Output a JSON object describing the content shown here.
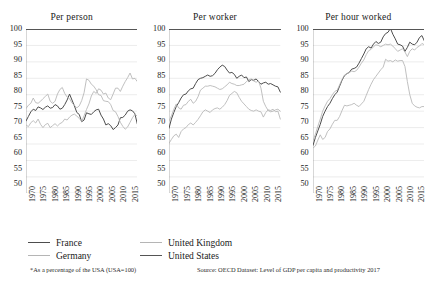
{
  "chart_data": {
    "type": "line",
    "title": "",
    "subtitle": "",
    "xlabel": "",
    "ylabel": "",
    "ylim": [
      50,
      100
    ],
    "xlim": [
      1970,
      2016
    ],
    "ytick_step": 5,
    "yticks": [
      50,
      55,
      60,
      65,
      70,
      75,
      80,
      85,
      90,
      95,
      100
    ],
    "xticks": [
      1970,
      1975,
      1980,
      1985,
      1990,
      1995,
      2000,
      2005,
      2010,
      2015
    ],
    "grid": true,
    "legend_position": "bottom-left",
    "note": "*As a percentage of the USA (USA=100)",
    "source": "Source: OECD Dataset: Level of GDP per capita and productivity 2017",
    "colors": {
      "France": "#4d4d4d",
      "Germany": "#b5b5b5",
      "United Kingdom": "#b5b5b5",
      "United States": "#555555"
    },
    "x": [
      1970,
      1971,
      1972,
      1973,
      1974,
      1975,
      1976,
      1977,
      1978,
      1979,
      1980,
      1981,
      1982,
      1983,
      1984,
      1985,
      1986,
      1987,
      1988,
      1989,
      1990,
      1991,
      1992,
      1993,
      1994,
      1995,
      1996,
      1997,
      1998,
      1999,
      2000,
      2001,
      2002,
      2003,
      2004,
      2005,
      2006,
      2007,
      2008,
      2009,
      2010,
      2011,
      2012,
      2013,
      2014,
      2015,
      2016
    ],
    "panels": [
      {
        "title": "Per person",
        "series": [
          {
            "name": "France",
            "values": [
              72.0,
              73.4,
              74.8,
              75.6,
              75.2,
              76.3,
              76.0,
              75.5,
              76.2,
              76.6,
              75.9,
              76.1,
              77.0,
              76.6,
              75.6,
              75.9,
              77.0,
              78.4,
              80.2,
              78.4,
              76.6,
              74.6,
              74.0,
              71.8,
              72.3,
              74.5,
              74.2,
              74.0,
              74.8,
              75.4,
              75.6,
              73.8,
              72.6,
              70.8,
              71.2,
              70.6,
              69.4,
              70.0,
              70.8,
              73.0,
              73.1,
              73.8,
              75.0,
              75.4,
              75.1,
              74.2,
              71.1
            ]
          },
          {
            "name": "Germany",
            "values": [
              70.8,
              70.3,
              71.5,
              72.1,
              71.4,
              72.6,
              71.0,
              70.0,
              70.9,
              71.3,
              70.0,
              70.6,
              71.2,
              70.5,
              71.2,
              71.6,
              72.6,
              72.3,
              73.2,
              73.8,
              74.1,
              73.5,
              72.8,
              71.9,
              73.6,
              75.5,
              77.2,
              79.6,
              81.0,
              80.4,
              81.8,
              81.4,
              80.2,
              80.5,
              79.0,
              78.5,
              80.2,
              82.0,
              82.0,
              81.0,
              82.6,
              84.0,
              85.2,
              86.6,
              84.8,
              85.0,
              84.0
            ]
          },
          {
            "name": "United Kingdom",
            "values": [
              75.8,
              76.8,
              77.4,
              79.0,
              77.6,
              77.4,
              78.0,
              78.8,
              79.5,
              80.2,
              78.0,
              77.4,
              78.0,
              80.2,
              81.6,
              82.2,
              80.4,
              79.3,
              78.8,
              77.5,
              76.8,
              76.0,
              76.6,
              78.2,
              80.6,
              84.8,
              84.4,
              83.2,
              82.6,
              81.5,
              80.0,
              79.8,
              78.2,
              78.0,
              77.9,
              77.0,
              75.2,
              74.8,
              73.4,
              71.6,
              70.4,
              69.5,
              70.2,
              71.6,
              73.0,
              74.0,
              73.5
            ]
          },
          {
            "name": "United States",
            "values": [
              100,
              100,
              100,
              100,
              100,
              100,
              100,
              100,
              100,
              100,
              100,
              100,
              100,
              100,
              100,
              100,
              100,
              100,
              100,
              100,
              100,
              100,
              100,
              100,
              100,
              100,
              100,
              100,
              100,
              100,
              100,
              100,
              100,
              100,
              100,
              100,
              100,
              100,
              100,
              100,
              100,
              100,
              100,
              100,
              100,
              100,
              100
            ]
          }
        ]
      },
      {
        "title": "Per worker",
        "series": [
          {
            "name": "France",
            "values": [
              69.8,
              72.6,
              74.6,
              76.4,
              77.6,
              79.0,
              80.0,
              80.2,
              81.2,
              81.8,
              82.0,
              83.4,
              84.6,
              85.0,
              85.2,
              85.6,
              86.0,
              85.6,
              85.8,
              86.5,
              87.6,
              88.4,
              89.0,
              88.6,
              87.5,
              86.6,
              86.8,
              86.2,
              85.0,
              85.6,
              86.0,
              85.2,
              85.4,
              84.0,
              84.6,
              84.4,
              84.8,
              84.0,
              83.2,
              83.6,
              83.8,
              83.2,
              83.4,
              83.0,
              82.6,
              82.4,
              80.8
            ]
          },
          {
            "name": "Germany",
            "values": [
              65.2,
              66.4,
              67.5,
              68.0,
              67.0,
              68.8,
              69.6,
              70.0,
              70.9,
              71.4,
              70.8,
              71.6,
              72.5,
              73.6,
              74.8,
              75.4,
              75.0,
              74.6,
              75.4,
              75.8,
              76.0,
              75.6,
              76.2,
              77.0,
              78.2,
              79.8,
              80.4,
              81.0,
              80.6,
              79.2,
              78.0,
              77.2,
              76.4,
              75.6,
              75.2,
              75.0,
              75.4,
              75.0,
              74.8,
              73.2,
              74.6,
              75.4,
              75.2,
              75.6,
              74.8,
              75.0,
              72.6
            ]
          },
          {
            "name": "United Kingdom",
            "values": [
              72.0,
              73.6,
              75.6,
              77.2,
              76.0,
              75.6,
              76.8,
              77.0,
              78.0,
              78.6,
              77.4,
              78.0,
              79.4,
              81.4,
              82.0,
              82.6,
              82.6,
              82.8,
              82.6,
              82.4,
              82.0,
              81.6,
              81.8,
              82.4,
              83.0,
              83.8,
              83.4,
              83.2,
              82.8,
              82.8,
              83.0,
              83.2,
              84.0,
              84.6,
              84.8,
              84.2,
              83.8,
              84.2,
              82.0,
              78.0,
              76.4,
              75.2,
              74.8,
              75.0,
              75.4,
              75.6,
              75.0
            ]
          },
          {
            "name": "United States",
            "values": [
              100,
              100,
              100,
              100,
              100,
              100,
              100,
              100,
              100,
              100,
              100,
              100,
              100,
              100,
              100,
              100,
              100,
              100,
              100,
              100,
              100,
              100,
              100,
              100,
              100,
              100,
              100,
              100,
              100,
              100,
              100,
              100,
              100,
              100,
              100,
              100,
              100,
              100,
              100,
              100,
              100,
              100,
              100,
              100,
              100,
              100,
              100
            ]
          }
        ]
      },
      {
        "title": "Per hour worked",
        "series": [
          {
            "name": "France",
            "values": [
              64.6,
              67.0,
              69.0,
              71.0,
              73.4,
              75.0,
              76.4,
              77.4,
              78.8,
              80.0,
              80.8,
              82.6,
              84.4,
              85.8,
              86.4,
              86.8,
              87.8,
              88.0,
              88.4,
              89.6,
              91.0,
              92.4,
              94.0,
              94.6,
              94.2,
              95.4,
              96.2,
              95.6,
              96.0,
              97.6,
              98.6,
              99.0,
              100.2,
              98.4,
              97.0,
              95.4,
              95.2,
              94.8,
              93.2,
              94.4,
              96.0,
              95.4,
              95.2,
              96.0,
              97.4,
              98.0,
              96.4
            ]
          },
          {
            "name": "Germany",
            "values": [
              66.0,
              68.0,
              70.4,
              72.6,
              75.0,
              76.6,
              78.0,
              78.8,
              80.0,
              81.0,
              81.4,
              83.0,
              84.6,
              86.0,
              86.4,
              86.8,
              87.2,
              87.0,
              87.4,
              88.4,
              89.6,
              90.6,
              92.2,
              93.4,
              93.8,
              94.6,
              95.2,
              95.0,
              94.6,
              95.0,
              95.4,
              95.2,
              95.4,
              94.8,
              94.0,
              93.2,
              93.6,
              94.0,
              93.0,
              91.6,
              93.2,
              94.0,
              93.6,
              94.4,
              94.8,
              95.6,
              95.2
            ]
          },
          {
            "name": "United Kingdom",
            "values": [
              63.8,
              64.4,
              66.2,
              67.8,
              66.4,
              67.0,
              68.8,
              69.6,
              71.0,
              72.2,
              72.2,
              73.4,
              75.2,
              76.8,
              76.6,
              76.8,
              77.0,
              77.4,
              76.8,
              76.4,
              77.2,
              78.0,
              79.8,
              81.6,
              83.2,
              84.6,
              85.6,
              86.6,
              87.6,
              88.4,
              90.8,
              90.2,
              90.4,
              90.0,
              90.6,
              90.2,
              90.4,
              90.4,
              88.6,
              84.0,
              80.0,
              77.4,
              76.6,
              76.2,
              76.0,
              76.4,
              76.4
            ]
          },
          {
            "name": "United States",
            "values": [
              100,
              100,
              100,
              100,
              100,
              100,
              100,
              100,
              100,
              100,
              100,
              100,
              100,
              100,
              100,
              100,
              100,
              100,
              100,
              100,
              100,
              100,
              100,
              100,
              100,
              100,
              100,
              100,
              100,
              100,
              100,
              100,
              100,
              100,
              100,
              100,
              100,
              100,
              100,
              100,
              100,
              100,
              100,
              100,
              100,
              100,
              100
            ]
          }
        ]
      }
    ],
    "legend": [
      {
        "label": "France",
        "color": "#4d4d4d",
        "width": 1.7
      },
      {
        "label": "Germany",
        "color": "#b5b5b5",
        "width": 1.3
      },
      {
        "label": "United Kingdom",
        "color": "#b5b5b5",
        "width": 1.3
      },
      {
        "label": "United States",
        "color": "#555555",
        "width": 1.9
      }
    ]
  }
}
